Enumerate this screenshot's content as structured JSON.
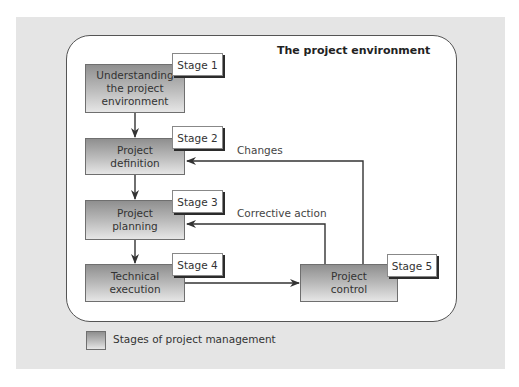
{
  "diagram": {
    "environment_title": "The project environment",
    "stages": [
      {
        "stage_label": "Stage 1",
        "text": "Understanding the project environment"
      },
      {
        "stage_label": "Stage 2",
        "text": "Project definition"
      },
      {
        "stage_label": "Stage 3",
        "text": "Project planning"
      },
      {
        "stage_label": "Stage 4",
        "text": "Technical execution"
      },
      {
        "stage_label": "Stage 5",
        "text": "Project control"
      }
    ],
    "feedback": {
      "changes": "Changes",
      "corrective_action": "Corrective action"
    },
    "edges": [
      {
        "from": "Stage 1",
        "to": "Stage 2"
      },
      {
        "from": "Stage 2",
        "to": "Stage 3"
      },
      {
        "from": "Stage 3",
        "to": "Stage 4"
      },
      {
        "from": "Stage 4",
        "to": "Stage 5"
      },
      {
        "from": "Stage 5",
        "to": "Stage 2",
        "label": "Changes"
      },
      {
        "from": "Stage 5",
        "to": "Stage 3",
        "label": "Corrective action"
      }
    ]
  },
  "legend": {
    "label": "Stages of project management"
  },
  "colors": {
    "panel_bg": "#e5e5e5",
    "box_gradient_top": "#8f8f8f",
    "box_gradient_bottom": "#e6e6e6",
    "line": "#333333"
  }
}
